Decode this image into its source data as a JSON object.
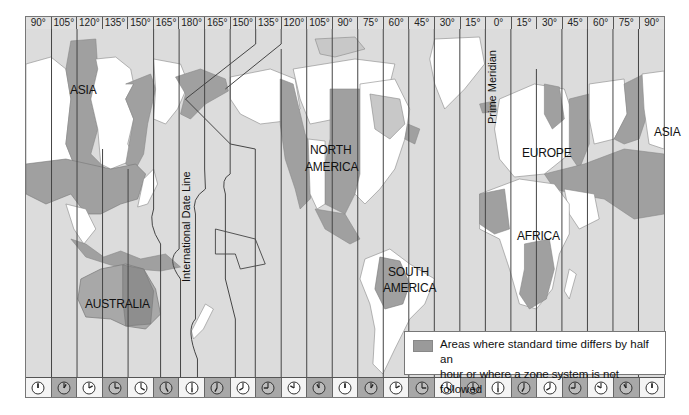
{
  "map": {
    "title": "World Time Zones",
    "longitude_labels": [
      "90°",
      "105°",
      "120°",
      "135°",
      "150°",
      "165°",
      "180°",
      "165°",
      "150°",
      "135°",
      "120°",
      "105°",
      "90°",
      "75°",
      "60°",
      "45°",
      "30°",
      "15°",
      "0°",
      "15°",
      "30°",
      "45°",
      "60°",
      "75°",
      "90°"
    ],
    "region_labels": {
      "asia_west": "ASIA",
      "asia_east": "ASIA",
      "north_america": "NORTH\nAMERICA",
      "north_america_line1": "NORTH",
      "north_america_line2": "AMERICA",
      "south_america_line1": "SOUTH",
      "south_america_line2": "AMERICA",
      "europe": "EUROPE",
      "africa": "AFRICA",
      "australia": "AUSTRALIA"
    },
    "line_labels": {
      "date_line": "International Date Line",
      "prime_meridian": "Prime Meridian"
    },
    "clock_hours": [
      12,
      1,
      2,
      3,
      4,
      5,
      6,
      7,
      8,
      9,
      10,
      11,
      12,
      1,
      2,
      3,
      4,
      5,
      6,
      7,
      8,
      9,
      10,
      11,
      12
    ],
    "clock_shading": [
      "light",
      "dark",
      "light",
      "dark",
      "light",
      "dark",
      "light",
      "dark",
      "light",
      "dark",
      "light",
      "dark",
      "light",
      "dark",
      "light",
      "dark",
      "light",
      "dark",
      "light",
      "dark",
      "light",
      "dark",
      "light",
      "dark",
      "light"
    ],
    "legend": {
      "text": "Areas where standard time differs by half an hour or where a zone system is not followed",
      "line1": "Areas where standard time differs by half an",
      "line2": "hour or where a zone system is not followed",
      "swatch_color": "#9a9a9a"
    },
    "colors": {
      "ocean": "#dcdcdc",
      "land_light": "#ffffff",
      "land_dark": "#a0a0a0",
      "land_mid": "#c8c8c8",
      "lines": "#444444"
    }
  }
}
